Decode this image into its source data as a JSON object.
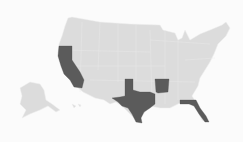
{
  "map": {
    "region": "United States",
    "base_color": "#dcdcdc",
    "highlight_color": "#5b5b5b",
    "background": "#fbfbfb",
    "highlighted_states": [
      "California",
      "Texas",
      "Arkansas",
      "Florida"
    ]
  }
}
